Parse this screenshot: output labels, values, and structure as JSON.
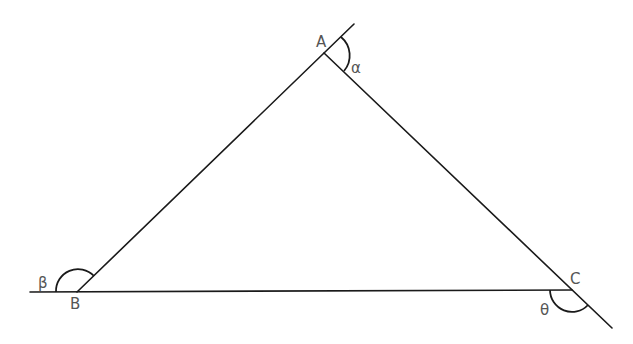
{
  "diagram": {
    "type": "triangle-exterior-angles",
    "vertices": [
      {
        "id": "A",
        "label": "A",
        "x": 324,
        "y": 53
      },
      {
        "id": "B",
        "label": "B",
        "x": 77,
        "y": 292
      },
      {
        "id": "C",
        "label": "C",
        "x": 572,
        "y": 290
      }
    ],
    "angles": [
      {
        "id": "alpha",
        "label": "α",
        "vertex": "A"
      },
      {
        "id": "beta",
        "label": "β",
        "vertex": "B"
      },
      {
        "id": "theta",
        "label": "θ",
        "vertex": "C"
      }
    ],
    "colors": {
      "line": "#1a1a1a",
      "label": "#555555",
      "background": "#ffffff"
    }
  }
}
